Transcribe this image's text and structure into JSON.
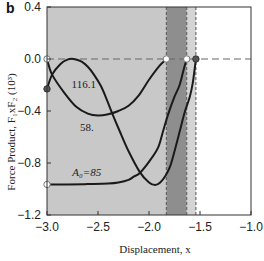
{
  "panel_label": "b",
  "chart_data": {
    "type": "line",
    "title": "",
    "xlabel": "Displacement, x",
    "ylabel": "Force Product, F₁xF₂ (10³)",
    "xlim": [
      -3.0,
      -1.0
    ],
    "ylim": [
      -1.2,
      0.4
    ],
    "xticks": [
      -3.0,
      -2.5,
      -2.0,
      -1.5,
      -1.0
    ],
    "xtick_labels": [
      "−3.0",
      "−2.5",
      "−2.0",
      "−1.5",
      "−1.0"
    ],
    "yticks": [
      0.4,
      0.0,
      -0.4,
      -0.8,
      -1.2
    ],
    "ytick_labels": [
      "0.4",
      "0.0",
      "−0.4",
      "−0.8",
      "−1.2"
    ],
    "grid": false,
    "legend": "none",
    "reference_lines": {
      "horizontal": [
        0.0
      ],
      "vertical": [
        -1.83,
        -1.63,
        -1.54
      ]
    },
    "shaded_regions": [
      {
        "x": [
          -3.0,
          -1.83
        ],
        "color": "#c8c8c8"
      },
      {
        "x": [
          -1.83,
          -1.63
        ],
        "color": "#8e8e8e"
      },
      {
        "x": [
          -1.63,
          -1.54
        ],
        "color": "#d4d4d4"
      }
    ],
    "series": [
      {
        "name": "116.1",
        "start_marker": "filled",
        "end_marker": "filled",
        "points": [
          [
            -3.0,
            -0.23
          ],
          [
            -2.95,
            -0.12
          ],
          [
            -2.87,
            -0.04
          ],
          [
            -2.8,
            -0.005
          ],
          [
            -2.74,
            0.0
          ],
          [
            -2.66,
            -0.02
          ],
          [
            -2.6,
            -0.06
          ],
          [
            -2.54,
            -0.12
          ],
          [
            -2.47,
            -0.21
          ],
          [
            -2.41,
            -0.32
          ],
          [
            -2.36,
            -0.42
          ],
          [
            -2.29,
            -0.55
          ],
          [
            -2.2,
            -0.71
          ],
          [
            -2.09,
            -0.87
          ],
          [
            -2.0,
            -0.95
          ],
          [
            -1.94,
            -0.97
          ],
          [
            -1.89,
            -0.95
          ],
          [
            -1.84,
            -0.9
          ],
          [
            -1.79,
            -0.82
          ],
          [
            -1.74,
            -0.68
          ],
          [
            -1.7,
            -0.56
          ],
          [
            -1.65,
            -0.41
          ],
          [
            -1.6,
            -0.29
          ],
          [
            -1.57,
            -0.18
          ],
          [
            -1.54,
            0.0
          ]
        ]
      },
      {
        "name": "58.",
        "start_marker": "open",
        "end_marker": "open",
        "points": [
          [
            -3.0,
            0.0
          ],
          [
            -2.95,
            -0.12
          ],
          [
            -2.83,
            -0.26
          ],
          [
            -2.71,
            -0.37
          ],
          [
            -2.6,
            -0.42
          ],
          [
            -2.5,
            -0.435
          ],
          [
            -2.4,
            -0.425
          ],
          [
            -2.3,
            -0.4
          ],
          [
            -2.2,
            -0.36
          ],
          [
            -2.1,
            -0.28
          ],
          [
            -2.0,
            -0.16
          ],
          [
            -1.9,
            -0.055
          ],
          [
            -1.83,
            0.0
          ]
        ]
      },
      {
        "name": "A₀=85",
        "start_marker": "open",
        "end_marker": "open",
        "points": [
          [
            -3.0,
            -0.965
          ],
          [
            -2.8,
            -0.965
          ],
          [
            -2.6,
            -0.962
          ],
          [
            -2.4,
            -0.958
          ],
          [
            -2.3,
            -0.95
          ],
          [
            -2.2,
            -0.93
          ],
          [
            -2.15,
            -0.905
          ],
          [
            -2.09,
            -0.877
          ],
          [
            -1.99,
            -0.78
          ],
          [
            -1.91,
            -0.68
          ],
          [
            -1.86,
            -0.55
          ],
          [
            -1.81,
            -0.42
          ],
          [
            -1.75,
            -0.29
          ],
          [
            -1.7,
            -0.2
          ],
          [
            -1.66,
            -0.08
          ],
          [
            -1.63,
            0.0
          ]
        ]
      }
    ],
    "annotations": [
      {
        "text": "116.1",
        "x": -2.64,
        "y": -0.19,
        "italic_prefix": ""
      },
      {
        "text": "58.",
        "x": -2.61,
        "y": -0.52,
        "italic_prefix": ""
      },
      {
        "text": "A₀=85",
        "x": -2.61,
        "y": -0.87,
        "italic_prefix": "A"
      }
    ]
  }
}
